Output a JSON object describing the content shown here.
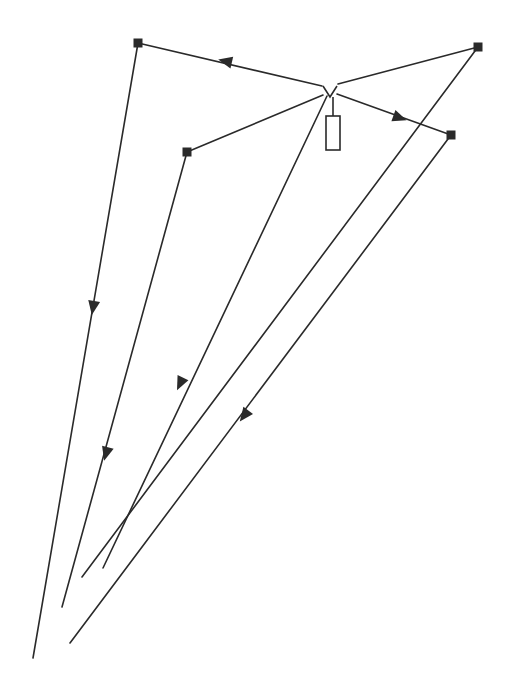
{
  "diagram": {
    "type": "ray-diagram",
    "width": 506,
    "height": 691,
    "background": "#ffffff",
    "stroke_color": "#2a2a2a",
    "stroke_width": 1.6,
    "source": {
      "apex": [
        330,
        90
      ],
      "v_left": [
        323,
        86
      ],
      "v_right": [
        337,
        86
      ],
      "rect": {
        "x": 326,
        "y": 116,
        "w": 14,
        "h": 34
      },
      "stem": [
        [
          333,
          97
        ],
        [
          333,
          116
        ]
      ]
    },
    "nodes": [
      {
        "id": "A",
        "x": 138,
        "y": 43,
        "size": 9
      },
      {
        "id": "B",
        "x": 478,
        "y": 47,
        "size": 9
      },
      {
        "id": "C",
        "x": 451,
        "y": 135,
        "size": 9
      },
      {
        "id": "D",
        "x": 187,
        "y": 152,
        "size": 9
      }
    ],
    "segments": [
      {
        "id": "src-A",
        "from": [
          322,
          86
        ],
        "to": [
          138,
          43
        ]
      },
      {
        "id": "src-B",
        "from": [
          338,
          84
        ],
        "to": [
          478,
          47
        ]
      },
      {
        "id": "src-C",
        "from": [
          337,
          94
        ],
        "to": [
          451,
          135
        ]
      },
      {
        "id": "src-D",
        "from": [
          323,
          95
        ],
        "to": [
          187,
          152
        ]
      },
      {
        "id": "A-end",
        "from": [
          138,
          43
        ],
        "to": [
          33,
          658
        ]
      },
      {
        "id": "B-end",
        "from": [
          478,
          47
        ],
        "to": [
          82,
          577
        ]
      },
      {
        "id": "C-end",
        "from": [
          451,
          135
        ],
        "to": [
          70,
          643
        ]
      },
      {
        "id": "D-end",
        "from": [
          187,
          152
        ],
        "to": [
          62,
          607
        ]
      },
      {
        "id": "src-direct",
        "from": [
          327,
          96
        ],
        "to": [
          103,
          568
        ]
      }
    ],
    "arrows": [
      {
        "on": "src-A",
        "at": [
          225,
          61
        ],
        "dir": [
          -184,
          -43
        ]
      },
      {
        "on": "src-C",
        "at": [
          400,
          118
        ],
        "dir": [
          114,
          41
        ]
      },
      {
        "on": "A-end",
        "at": [
          93,
          308
        ],
        "dir": [
          -105,
          615
        ]
      },
      {
        "on": "src-direct",
        "at": [
          180,
          384
        ],
        "dir": [
          -224,
          472
        ]
      },
      {
        "on": "D-end",
        "at": [
          106,
          454
        ],
        "dir": [
          -125,
          455
        ]
      },
      {
        "on": "C-end",
        "at": [
          244,
          416
        ],
        "dir": [
          -381,
          508
        ]
      }
    ]
  }
}
